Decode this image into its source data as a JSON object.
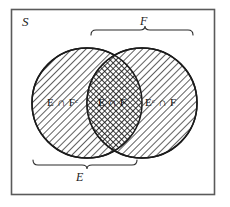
{
  "figure": {
    "kind": "venn-diagram",
    "universe_label": "S",
    "regions": [
      {
        "id": "left-only",
        "set_text": "E ∩ F",
        "superscript": "c",
        "sup_on": "second",
        "display": "E ∩ Fᶜ"
      },
      {
        "id": "intersection",
        "set_text": "E ∩ F",
        "superscript": "",
        "sup_on": "none",
        "display": "E ∩ F"
      },
      {
        "id": "right-only",
        "set_text": "E ∩ F",
        "superscript": "c",
        "sup_on": "first",
        "display": "Eᶜ ∩ F"
      }
    ],
    "braces": [
      {
        "id": "top",
        "label": "F",
        "position": "above",
        "spans": "right-circle"
      },
      {
        "id": "bottom",
        "label": "E",
        "position": "below",
        "spans": "left-circle"
      }
    ],
    "colors": {
      "ink": "#1b1b1b",
      "frame": "#555555",
      "hatch": "#2b2b2b",
      "background": "#ffffff"
    },
    "fills": {
      "left_only": "diagonal-hatch",
      "right_only": "diagonal-hatch",
      "intersection": "cross-hatch"
    }
  }
}
